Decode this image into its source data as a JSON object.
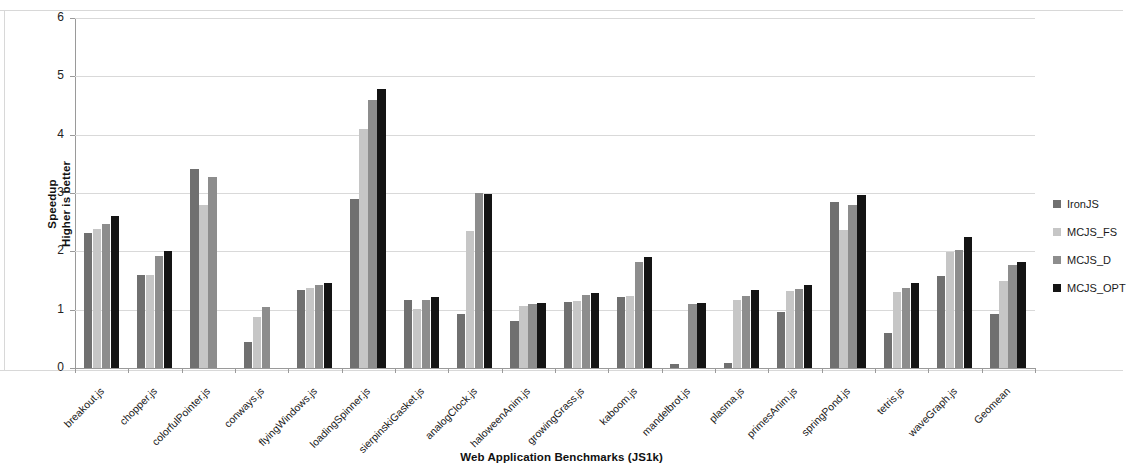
{
  "chart_data": {
    "type": "bar",
    "title": "",
    "xlabel": "Web Application Benchmarks (JS1k)",
    "ylabel": "Speedup\nHigher is better",
    "ylabel_line1": "Speedup",
    "ylabel_line2": "Higher is better",
    "ylim": [
      0,
      6
    ],
    "yticks": [
      0,
      1,
      2,
      3,
      4,
      5,
      6
    ],
    "grid": true,
    "legend_position": "right",
    "categories": [
      "breakout.js",
      "chopper.js",
      "colorfulPointer.js",
      "conways.js",
      "flyingWindows.js",
      "loadingSpinner.js",
      "sierpinskiGasket.js",
      "analogClock.js",
      "haloweenAnim.js",
      "growingGrass.js",
      "kaboom.js",
      "mandelbrot.js",
      "plasma.js",
      "primesAnim.js",
      "springPond.js",
      "tetris.js",
      "waveGraph.js",
      "Geomean"
    ],
    "series": [
      {
        "name": "IronJS",
        "color": "#707070",
        "values": [
          2.31,
          1.6,
          3.42,
          0.45,
          1.33,
          2.9,
          1.16,
          0.92,
          0.8,
          1.13,
          1.22,
          0.07,
          0.08,
          0.96,
          2.85,
          0.6,
          1.58,
          0.93
        ]
      },
      {
        "name": "MCJS_FS",
        "color": "#c6c6c6",
        "values": [
          2.38,
          1.6,
          2.8,
          0.87,
          1.37,
          4.1,
          1.02,
          2.35,
          1.06,
          1.15,
          1.23,
          0.0,
          1.17,
          1.32,
          2.37,
          1.3,
          1.99,
          1.5
        ]
      },
      {
        "name": "MCJS_D",
        "color": "#8d8d8d",
        "values": [
          2.47,
          1.92,
          3.28,
          1.05,
          1.43,
          4.6,
          1.17,
          3.0,
          1.1,
          1.25,
          1.82,
          1.1,
          1.24,
          1.36,
          2.8,
          1.38,
          2.03,
          1.77
        ]
      },
      {
        "name": "MCJS_OPT",
        "color": "#141414",
        "values": [
          2.6,
          2.01,
          0.0,
          0.0,
          1.46,
          4.78,
          1.21,
          2.98,
          1.12,
          1.28,
          1.9,
          1.12,
          1.34,
          1.42,
          2.97,
          1.45,
          2.25,
          1.82
        ]
      }
    ]
  },
  "legend": {
    "items": [
      {
        "label": "IronJS",
        "color": "#707070"
      },
      {
        "label": "MCJS_FS",
        "color": "#c6c6c6"
      },
      {
        "label": "MCJS_D",
        "color": "#8d8d8d"
      },
      {
        "label": "MCJS_OPT",
        "color": "#141414"
      }
    ]
  },
  "axes": {
    "y_title_line1": "Speedup",
    "y_title_line2": "Higher is better",
    "x_title": "Web Application Benchmarks (JS1k)"
  }
}
